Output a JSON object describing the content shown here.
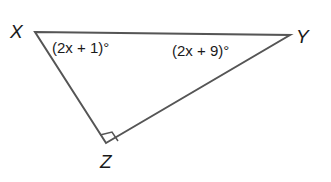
{
  "diagram": {
    "type": "right-triangle",
    "vertices": {
      "X": {
        "label": "X"
      },
      "Y": {
        "label": "Y"
      },
      "Z": {
        "label": "Z"
      }
    },
    "angles": {
      "X": "(2x + 1)°",
      "Y": "(2x + 9)°",
      "Z": "right angle"
    },
    "colors": {
      "line": "#555555",
      "text": "#1a1a1a"
    }
  }
}
